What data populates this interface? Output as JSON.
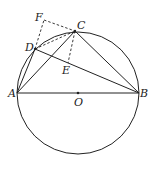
{
  "diagram": {
    "type": "geometry",
    "points": {
      "A": {
        "label": "A",
        "x": 17,
        "y": 93
      },
      "B": {
        "label": "B",
        "x": 139,
        "y": 93
      },
      "O": {
        "label": "O",
        "x": 78,
        "y": 93
      },
      "C": {
        "label": "C",
        "x": 75,
        "y": 31
      },
      "D": {
        "label": "D",
        "x": 35,
        "y": 49
      },
      "E": {
        "label": "E",
        "x": 68,
        "y": 63
      },
      "F": {
        "label": "F",
        "x": 44,
        "y": 20
      }
    },
    "circle": {
      "center": "O",
      "radius": 61
    },
    "solid_segments": [
      "AB",
      "AC",
      "AD",
      "BC",
      "DB"
    ],
    "dashed_segments": [
      "DF",
      "FC",
      "DC",
      "CE"
    ],
    "colors": {
      "stroke": "#222222",
      "background": "#ffffff"
    }
  }
}
